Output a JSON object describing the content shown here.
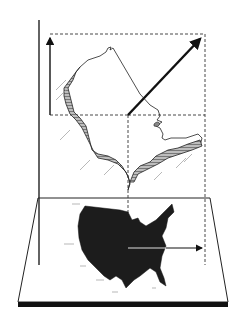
{
  "diagram": {
    "kind": "3d-map-projection-illustration",
    "text_labels": [],
    "colors": {
      "background": "#ffffff",
      "ink": "#1a1a1a",
      "silhouette": "#1c1c1c",
      "hatch_fill": "#8a8a8a",
      "dashed_guides": "#333333",
      "base_shadow": "#111111"
    },
    "elements": [
      {
        "name": "vertical-axis-line",
        "description": "tall vertical line at left"
      },
      {
        "name": "dashed-projection-box",
        "description": "dashed rectangle framing the projected coastline"
      },
      {
        "name": "up-arrow",
        "description": "vertical arrow on left edge of dashed box"
      },
      {
        "name": "diagonal-arrow",
        "description": "thick arrow pointing up-right"
      },
      {
        "name": "coastline-outline",
        "description": "raised 3D coastline with hatched walls"
      },
      {
        "name": "base-plane",
        "description": "flat parallelogram plane with dark edge"
      },
      {
        "name": "us-silhouette",
        "description": "black map of contiguous United States on plane"
      },
      {
        "name": "horizontal-arrow",
        "description": "arrow pointing right across the silhouette"
      }
    ]
  }
}
